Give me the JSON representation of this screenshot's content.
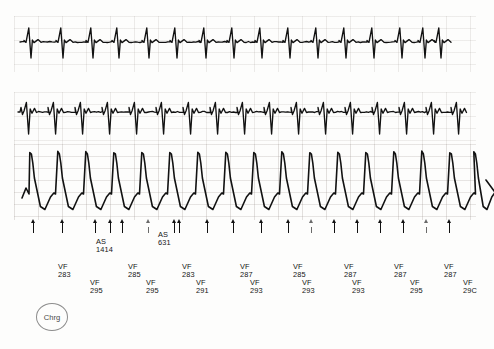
{
  "document": {
    "kind": "icd-stored-electrogram-strip",
    "background_color": "#fdfdfc",
    "trace_color": "#121212",
    "grid_color": "#968c87"
  },
  "channels": [
    {
      "name": "surface-ecg-channel",
      "label": "",
      "top": 16,
      "height": 56,
      "beat_count": 16,
      "morphology": "narrow-qrs-with-tall-negative-deflection"
    },
    {
      "name": "atrial-egm-channel",
      "label": "",
      "top": 92,
      "height": 52,
      "beat_count": 16,
      "morphology": "sharp-biphasic-spikes"
    },
    {
      "name": "ventricular-egm-channel",
      "label": "",
      "top": 144,
      "height": 76,
      "beat_count": 16,
      "morphology": "sawtooth-monophasic-large-amplitude"
    }
  ],
  "markers": {
    "name": "marker-channel",
    "arrow_positions": [
      33,
      62,
      95,
      110,
      122,
      148,
      174,
      179,
      207,
      233,
      261,
      288,
      311,
      334,
      357,
      380,
      403,
      426,
      449
    ],
    "faint_indices": [
      5,
      12,
      17
    ]
  },
  "events": {
    "atrial_sense": [
      {
        "tag": "AS",
        "value": "1414",
        "x": 96,
        "y": 238
      },
      {
        "tag": "AS",
        "value": "631",
        "x": 158,
        "y": 231
      }
    ],
    "vf_upper": [
      {
        "tag": "VF",
        "value": "283",
        "x": 58,
        "y": 263
      },
      {
        "tag": "VF",
        "value": "285",
        "x": 128,
        "y": 263
      },
      {
        "tag": "VF",
        "value": "283",
        "x": 182,
        "y": 263
      },
      {
        "tag": "VF",
        "value": "287",
        "x": 240,
        "y": 263
      },
      {
        "tag": "VF",
        "value": "285",
        "x": 293,
        "y": 263
      },
      {
        "tag": "VF",
        "value": "287",
        "x": 344,
        "y": 263
      },
      {
        "tag": "VF",
        "value": "287",
        "x": 394,
        "y": 263
      },
      {
        "tag": "VF",
        "value": "287",
        "x": 444,
        "y": 263
      }
    ],
    "vf_lower": [
      {
        "tag": "VF",
        "value": "295",
        "x": 90,
        "y": 279
      },
      {
        "tag": "VF",
        "value": "295",
        "x": 146,
        "y": 279
      },
      {
        "tag": "VF",
        "value": "291",
        "x": 196,
        "y": 279
      },
      {
        "tag": "VF",
        "value": "293",
        "x": 250,
        "y": 279
      },
      {
        "tag": "VF",
        "value": "293",
        "x": 302,
        "y": 279
      },
      {
        "tag": "VF",
        "value": "293",
        "x": 352,
        "y": 279
      },
      {
        "tag": "VF",
        "value": "295",
        "x": 410,
        "y": 279
      },
      {
        "tag": "VF",
        "value": "29C",
        "x": 463,
        "y": 279
      }
    ]
  },
  "charge_marker": {
    "label": "Chrg",
    "x": 36,
    "y": 303
  },
  "chart_data": {
    "type": "line",
    "title": "",
    "subtitle": "",
    "xlabel": "",
    "ylabel": "",
    "grid": true,
    "legend": "none",
    "series": [
      {
        "name": "surface-ecg",
        "baseline_y": 42,
        "beats_x": [
          30,
          62,
          92,
          118,
          148,
          176,
          205,
          233,
          261,
          289,
          317,
          345,
          373,
          401,
          424,
          440
        ],
        "r_amplitude": 14,
        "s_amplitude": 16
      },
      {
        "name": "atrial-egm",
        "baseline_y": 112,
        "beats_x": [
          28,
          55,
          82,
          109,
          136,
          163,
          190,
          217,
          244,
          271,
          298,
          325,
          352,
          379,
          406,
          433,
          458
        ],
        "spike_amplitude": 22
      },
      {
        "name": "ventricular-egm",
        "baseline_y": 210,
        "beats_x": [
          32,
          60,
          88,
          116,
          144,
          172,
          200,
          228,
          256,
          284,
          312,
          340,
          368,
          396,
          424,
          452,
          476
        ],
        "peak_amplitude": 58
      }
    ],
    "intervals_ms": [
      283,
      295,
      285,
      295,
      283,
      291,
      287,
      293,
      285,
      293,
      287,
      293,
      287,
      295,
      287,
      290
    ],
    "atrial_intervals_ms": [
      1414,
      631
    ],
    "rhythm_annotation": "VF"
  }
}
